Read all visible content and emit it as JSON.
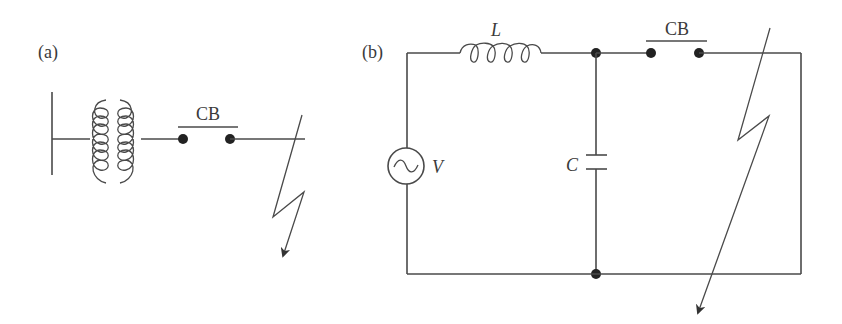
{
  "figure": {
    "panel_a": {
      "label": "(a)",
      "breaker_label": "CB",
      "components": [
        "bus-bar",
        "transformer",
        "circuit-breaker",
        "fault"
      ]
    },
    "panel_b": {
      "label": "(b)",
      "inductor_label": "L",
      "capacitor_label": "C",
      "source_label": "V",
      "breaker_label": "CB",
      "components": [
        "ac-voltage-source",
        "inductor",
        "capacitor",
        "circuit-breaker",
        "fault"
      ]
    },
    "colors": {
      "line": "#4a4a4a",
      "node": "#222222",
      "background": "#ffffff"
    }
  }
}
